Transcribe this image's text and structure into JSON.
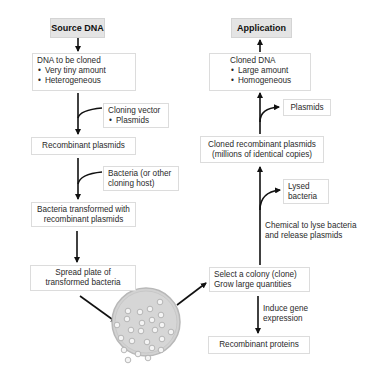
{
  "left_column": {
    "header": "Source DNA",
    "dna_box": {
      "title": "DNA to be cloned",
      "bullets": [
        "Very tiny amount",
        "Heterogeneous"
      ]
    },
    "vector_box": {
      "title": "Cloning vector",
      "bullets": [
        "Plasmids"
      ]
    },
    "recombinant_plasmids": "Recombinant plasmids",
    "host_box": {
      "line1": "Bacteria (or other",
      "line2": "cloning host)"
    },
    "transformed_box": {
      "line1": "Bacteria transformed with",
      "line2": "recombinant plasmids"
    },
    "spread_plate_box": {
      "line1": "Spread plate of",
      "line2": "transformed bacteria"
    }
  },
  "right_column": {
    "header": "Application",
    "cloned_dna_box": {
      "title": "Cloned DNA",
      "bullets": [
        "Large amount",
        "Homogeneous"
      ]
    },
    "plasmids_box": "Plasmids",
    "cloned_plasmids_box": {
      "line1": "Cloned recombinant plasmids",
      "line2": "(millions of identical copies)"
    },
    "lysed_box": {
      "line1": "Lysed",
      "line2": "bacteria"
    },
    "lyse_note": {
      "line1": "Chemical to lyse bacteria",
      "line2": "and release plasmids"
    },
    "select_box": {
      "line1": "Select a colony (clone)",
      "line2": "Grow large quantities"
    },
    "induce_note": {
      "line1": "Induce gene",
      "line2": "expression"
    },
    "proteins_box": "Recombinant proteins"
  },
  "petri_dish": {
    "label": "petri-dish-with-colonies",
    "colony_count": 24
  },
  "colors": {
    "header_fill": "#e4e4e4",
    "box_border": "#dcdcdc",
    "arrow": "#111111",
    "dish_fill": "#d2d2d2"
  }
}
